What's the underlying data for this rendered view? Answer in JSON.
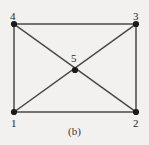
{
  "figure": {
    "caption": "(b)",
    "background_color": "#f2f1ef",
    "edge_color": "#4a4744",
    "node_color": "#1c1a18",
    "label_color": "#2a2724"
  },
  "graph": {
    "nodes": [
      {
        "id": "1",
        "label": "1",
        "x": 14,
        "y": 112,
        "label_x": 11,
        "label_y": 118
      },
      {
        "id": "2",
        "label": "2",
        "x": 136,
        "y": 112,
        "label_x": 133,
        "label_y": 118
      },
      {
        "id": "3",
        "label": "3",
        "x": 136,
        "y": 24,
        "label_x": 133,
        "label_y": 11
      },
      {
        "id": "4",
        "label": "4",
        "x": 14,
        "y": 24,
        "label_x": 10,
        "label_y": 11
      },
      {
        "id": "5",
        "label": "5",
        "x": 75,
        "y": 70,
        "label_x": 71,
        "label_y": 53
      }
    ],
    "edges": [
      {
        "from": "4",
        "to": "3"
      },
      {
        "from": "1",
        "to": "2"
      },
      {
        "from": "1",
        "to": "4"
      },
      {
        "from": "2",
        "to": "3"
      },
      {
        "from": "1",
        "to": "3"
      },
      {
        "from": "4",
        "to": "2"
      }
    ],
    "node_radius": 3.1,
    "edge_width": 1.5
  }
}
